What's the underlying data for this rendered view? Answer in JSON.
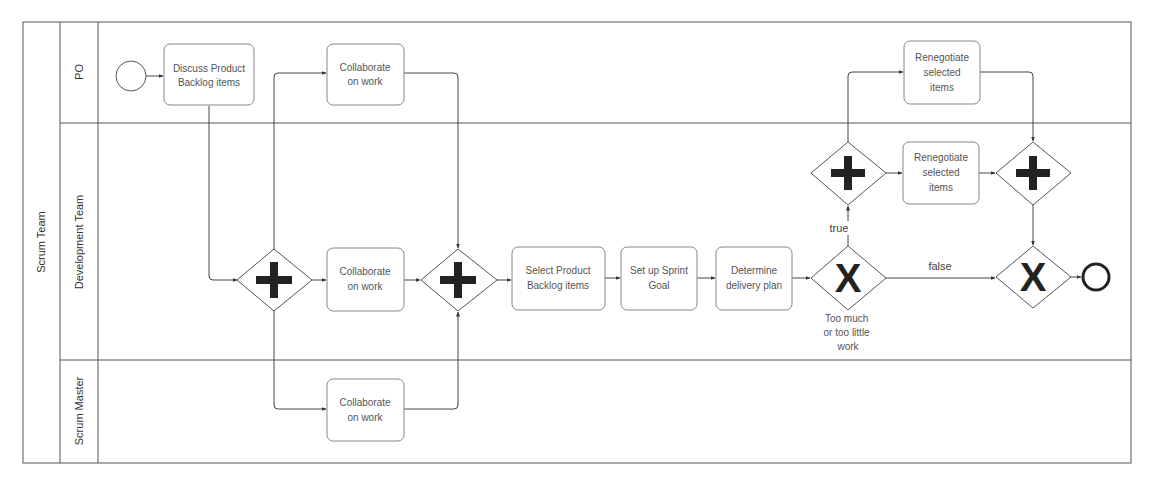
{
  "pool": {
    "label": "Scrum Team"
  },
  "lanes": [
    {
      "id": "po",
      "label": "PO"
    },
    {
      "id": "dev",
      "label": "Development Team"
    },
    {
      "id": "sm",
      "label": "Scrum Master"
    }
  ],
  "events": {
    "start": {
      "type": "start-event"
    },
    "end": {
      "type": "end-event"
    }
  },
  "tasks": {
    "discuss": {
      "lines": [
        "Discuss Product",
        "Backlog items"
      ],
      "lane": "PO"
    },
    "collab_po": {
      "lines": [
        "Collaborate",
        "on work"
      ],
      "lane": "PO"
    },
    "collab_dev": {
      "lines": [
        "Collaborate",
        "on work"
      ],
      "lane": "Development Team"
    },
    "collab_sm": {
      "lines": [
        "Collaborate",
        "on work"
      ],
      "lane": "Scrum Master"
    },
    "select_pbi": {
      "lines": [
        "Select Product",
        "Backlog items"
      ],
      "lane": "Development Team"
    },
    "sprint_goal": {
      "lines": [
        "Set up Sprint",
        "Goal"
      ],
      "lane": "Development Team"
    },
    "delivery_plan": {
      "lines": [
        "Determine",
        "delivery plan"
      ],
      "lane": "Development Team"
    },
    "reneg_po": {
      "lines": [
        "Renegotiate",
        "selected",
        "items"
      ],
      "lane": "PO"
    },
    "reneg_dev": {
      "lines": [
        "Renegotiate",
        "selected",
        "items"
      ],
      "lane": "Development Team"
    }
  },
  "gateways": {
    "split1": {
      "type": "parallel",
      "symbol": "+"
    },
    "join1": {
      "type": "parallel",
      "symbol": "+"
    },
    "decision": {
      "type": "exclusive",
      "symbol": "X",
      "label_lines": [
        "Too much",
        "or too little",
        "work"
      ]
    },
    "split2": {
      "type": "parallel",
      "symbol": "+"
    },
    "join2": {
      "type": "parallel",
      "symbol": "+"
    },
    "merge": {
      "type": "exclusive",
      "symbol": "X"
    }
  },
  "edges": {
    "true_label": "true",
    "false_label": "false"
  }
}
